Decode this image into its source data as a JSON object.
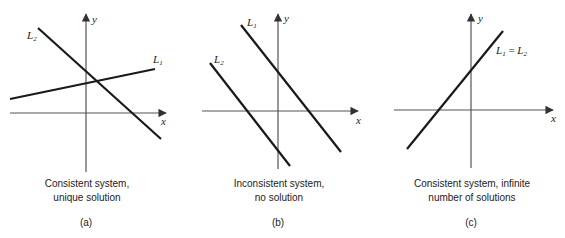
{
  "panels": [
    {
      "id": "a",
      "tag": "(a)",
      "caption_line1": "Consistent system,",
      "caption_line2": "unique solution",
      "axis_x_label": "x",
      "axis_y_label": "y",
      "lines": [
        {
          "name": "L1",
          "label_main": "L",
          "label_sub": "1",
          "from": [
            10,
            99
          ],
          "to": [
            155,
            69
          ]
        },
        {
          "name": "L2",
          "label_main": "L",
          "label_sub": "2",
          "from": [
            38,
            28
          ],
          "to": [
            161,
            139
          ]
        }
      ]
    },
    {
      "id": "b",
      "tag": "(b)",
      "caption_line1": "Inconsistent system,",
      "caption_line2": "no solution",
      "axis_x_label": "x",
      "axis_y_label": "y",
      "lines": [
        {
          "name": "L1",
          "label_main": "L",
          "label_sub": "1",
          "from": [
            241,
            25
          ],
          "to": [
            341,
            152
          ]
        },
        {
          "name": "L2",
          "label_main": "L",
          "label_sub": "2",
          "from": [
            210,
            63
          ],
          "to": [
            290,
            166
          ]
        }
      ]
    },
    {
      "id": "c",
      "tag": "(c)",
      "caption_line1": "Consistent system, infinite",
      "caption_line2": "number of solutions",
      "axis_x_label": "x",
      "axis_y_label": "y",
      "lines": [
        {
          "name": "L1=L2",
          "label_main_1": "L",
          "label_sub_1": "1",
          "label_eq": " = ",
          "label_main_2": "L",
          "label_sub_2": "2",
          "from": [
            407,
            149
          ],
          "to": [
            503,
            31
          ]
        }
      ]
    }
  ],
  "colors": {
    "line": "#1a1a1a",
    "axis": "#555555",
    "background": "#ffffff"
  }
}
